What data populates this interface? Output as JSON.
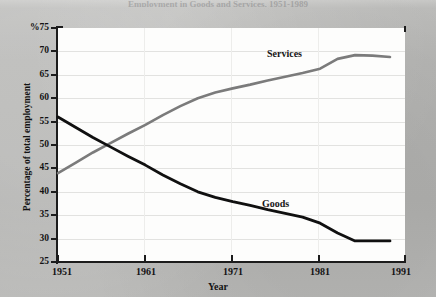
{
  "page": {
    "title_faint": "Employment in Goods and Services, 1951-1989",
    "background_color": "#b6b6b4",
    "plot_background_color": "#fdfdfc"
  },
  "axes": {
    "ylabel": "Percentage of total employment",
    "xlabel": "Year",
    "y_unit_prefix": "%",
    "y_ticks": [
      "%75",
      "70",
      "65",
      "60",
      "55",
      "50",
      "45",
      "40",
      "35",
      "30",
      "25"
    ],
    "x_ticks": [
      "1951",
      "1961",
      "1971",
      "1981",
      "1991"
    ]
  },
  "legend": {
    "services_label": "Services",
    "goods_label": "Goods"
  },
  "chart_data": {
    "type": "line",
    "title": "Employment in Goods and Services, 1951-1989",
    "xlabel": "Year",
    "ylabel": "Percentage of total employment",
    "xlim": [
      1951,
      1991
    ],
    "ylim": [
      25,
      75
    ],
    "grid": true,
    "legend_position": "inline-annotations",
    "x_ticks": [
      1951,
      1961,
      1971,
      1981,
      1991
    ],
    "y_ticks": [
      25,
      30,
      35,
      40,
      45,
      50,
      55,
      60,
      65,
      70,
      75
    ],
    "x": [
      1951,
      1953,
      1955,
      1957,
      1959,
      1961,
      1963,
      1965,
      1967,
      1969,
      1971,
      1973,
      1975,
      1977,
      1979,
      1981,
      1983,
      1985,
      1987,
      1989
    ],
    "series": [
      {
        "name": "Services",
        "color": "#7b7b7b",
        "values": [
          44.0,
          46.2,
          48.4,
          50.4,
          52.4,
          54.3,
          56.4,
          58.3,
          60.0,
          61.2,
          62.1,
          62.9,
          63.8,
          64.6,
          65.4,
          66.3,
          68.4,
          69.2,
          69.1,
          68.8
        ]
      },
      {
        "name": "Goods",
        "color": "#101010",
        "values": [
          56.0,
          53.8,
          51.6,
          49.6,
          47.6,
          45.7,
          43.6,
          41.7,
          40.0,
          38.8,
          37.9,
          37.1,
          36.2,
          35.4,
          34.6,
          33.3,
          31.2,
          29.5,
          29.5,
          29.5
        ]
      }
    ],
    "annotations": [
      {
        "text": "Services",
        "x": 1975,
        "y": 70.5
      },
      {
        "text": "Goods",
        "x": 1974,
        "y": 36.5
      }
    ]
  }
}
